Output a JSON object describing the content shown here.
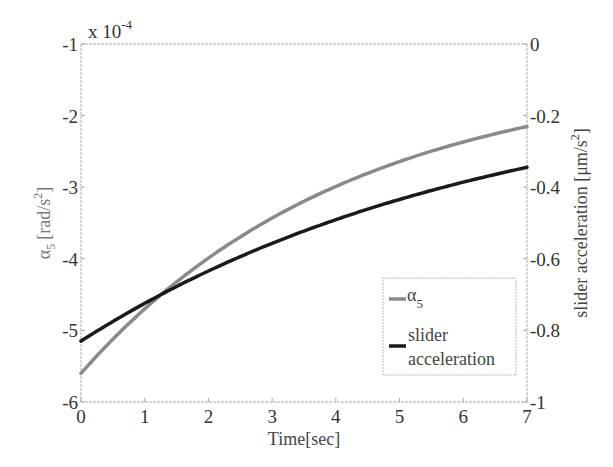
{
  "chart_data": {
    "type": "line",
    "title": "",
    "xlabel": "Time[sec]",
    "ylabel_left": "α5 [rad/s²]",
    "ylabel_right": "slider acceleration [μm/s²]",
    "left_axis_multiplier": "x 10^-4",
    "xlim": [
      0,
      7
    ],
    "ylim_left": [
      -6,
      -1
    ],
    "ylim_right": [
      -1,
      0
    ],
    "x_ticks": [
      "0",
      "1",
      "2",
      "3",
      "4",
      "5",
      "6",
      "7"
    ],
    "y_ticks_left": [
      "-1",
      "-2",
      "-3",
      "-4",
      "-5",
      "-6"
    ],
    "y_ticks_right": [
      "0",
      "-0.2",
      "-0.4",
      "-0.6",
      "-0.8",
      "-1"
    ],
    "grid": false,
    "legend_position": "lower right",
    "x": [
      0,
      0.5,
      1,
      1.5,
      2,
      2.5,
      3,
      3.5,
      4,
      4.5,
      5,
      5.5,
      6,
      6.5,
      7
    ],
    "series": [
      {
        "name": "α5",
        "axis": "left",
        "color": "#8a8a8a",
        "values": [
          -5.6,
          -5.12,
          -4.7,
          -4.3,
          -3.93,
          -3.6,
          -3.3,
          -3.03,
          -2.8,
          -2.6,
          -2.42,
          -2.26,
          -2.13,
          -2.03,
          -1.95
        ]
      },
      {
        "name": "slider acceleration",
        "axis": "right",
        "color": "#1a1a1a",
        "values": [
          -0.83,
          -0.79,
          -0.755,
          -0.722,
          -0.69,
          -0.662,
          -0.636,
          -0.612,
          -0.59,
          -0.57,
          -0.42,
          -0.403,
          -0.387,
          -0.372,
          -0.31
        ]
      }
    ]
  },
  "legend": {
    "items": [
      {
        "label": "α",
        "sub": "5",
        "color": "#8a8a8a"
      },
      {
        "label_line1": "slider",
        "label_line2": "acceleration",
        "color": "#1a1a1a"
      }
    ]
  },
  "axes": {
    "multiplier_base": "x 10",
    "multiplier_exp": "-4",
    "xlabel": "Time[sec]",
    "ylabel_left_symbol": "α",
    "ylabel_left_sub": "5",
    "ylabel_left_unit": "[rad/s",
    "ylabel_left_unit_exp": "2",
    "ylabel_left_close": "]",
    "ylabel_right_text": "slider acceleration [μm/s",
    "ylabel_right_exp": "2",
    "ylabel_right_close": "]"
  }
}
